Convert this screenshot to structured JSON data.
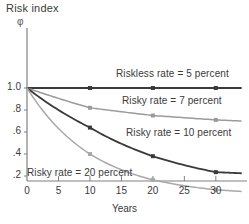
{
  "figure": {
    "title": "Risk index",
    "y_symbol": "φ",
    "xlabel": "Years"
  },
  "axes": {
    "y_ticks": [
      "1.0",
      ".8",
      ".6",
      ".4",
      ".2"
    ],
    "y_tick_values": [
      1.0,
      0.8,
      0.6,
      0.4,
      0.2
    ],
    "x_ticks": [
      "0",
      "5",
      "10",
      "15",
      "20",
      "25",
      "30"
    ],
    "x_tick_values": [
      0,
      5,
      10,
      15,
      20,
      25,
      30
    ],
    "xlim": [
      0,
      34
    ],
    "ylim": [
      0,
      1.12
    ]
  },
  "colors": {
    "riskless_5": "#3a3a3a",
    "risky_7": "#9a9a9a",
    "risky_10": "#3a3a3a",
    "risky_20": "#a8a8a8",
    "axis": "#808080",
    "text": "#3a3a3a"
  },
  "annotations": [
    {
      "id": "label-riskless-5",
      "text": "Riskless rate = 5 percent",
      "x": 116,
      "y": 68
    },
    {
      "id": "label-risky-7",
      "text": "Risky rate = 7 percent",
      "x": 122,
      "y": 95
    },
    {
      "id": "label-risky-10",
      "text": "Risky rate = 10 percent",
      "x": 126,
      "y": 127
    },
    {
      "id": "label-risky-20",
      "text": "Risky rate = 20 percent",
      "x": 27,
      "y": 167
    }
  ],
  "chart_data": {
    "type": "line",
    "title": "Risk index",
    "xlabel": "Years",
    "ylabel": "φ",
    "xlim": [
      0,
      34
    ],
    "ylim": [
      0,
      1.12
    ],
    "grid": false,
    "legend": "inline-annotations",
    "x": [
      0,
      10,
      20,
      30,
      34
    ],
    "series": [
      {
        "name": "Riskless rate = 5 percent",
        "color": "#3a3a3a",
        "markers_at": [
          10,
          20,
          30
        ],
        "values": [
          1.0,
          1.0,
          1.0,
          1.0,
          1.0
        ]
      },
      {
        "name": "Risky rate = 7 percent",
        "color": "#9a9a9a",
        "markers_at": [
          10,
          20,
          30
        ],
        "values": [
          1.0,
          0.82,
          0.75,
          0.71,
          0.7
        ]
      },
      {
        "name": "Risky rate = 10 percent",
        "color": "#3a3a3a",
        "markers_at": [
          10,
          20,
          30
        ],
        "values": [
          1.0,
          0.64,
          0.38,
          0.235,
          0.225
        ]
      },
      {
        "name": "Risky rate = 20 percent",
        "color": "#a8a8a8",
        "markers_at": [
          10,
          20,
          30
        ],
        "values": [
          1.0,
          0.4,
          0.165,
          0.075,
          0.06
        ]
      }
    ]
  }
}
